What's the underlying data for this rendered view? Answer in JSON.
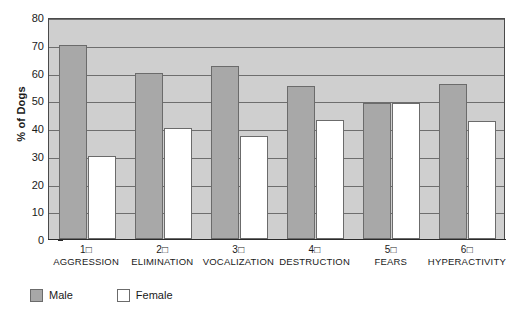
{
  "chart_data": {
    "type": "bar",
    "title": "",
    "subtitle": "",
    "xlabel": "",
    "ylabel": "% of Dogs",
    "ylim": [
      0,
      80
    ],
    "ytick_step": 10,
    "yticks": [
      0,
      10,
      20,
      30,
      40,
      50,
      60,
      70,
      80
    ],
    "ytick_labels": [
      "0",
      "10",
      "20",
      "30",
      "40",
      "50",
      "60",
      "70",
      "80"
    ],
    "grid": true,
    "grid_axis": "y",
    "legend_position": "below-bottom-left",
    "categories": [
      "AGGRESSION",
      "ELIMINATION",
      "VOCALIZATION",
      "DESTRUCTION",
      "FEARS",
      "HYPERACTIVITY"
    ],
    "category_numbers": [
      "1□",
      "2□",
      "3□",
      "4□",
      "5□",
      "6□"
    ],
    "series": [
      {
        "name": "Male",
        "color": "#a8a8a8",
        "values": [
          70,
          60,
          62.5,
          55,
          49,
          56
        ]
      },
      {
        "name": "Female",
        "color": "#ffffff",
        "values": [
          30,
          40,
          37,
          43,
          49,
          42.5
        ]
      }
    ],
    "plot_background": "#cfcfcf",
    "gridline_color": "#6e6e6e",
    "axis_color": "#2b2b2b",
    "bar_border_color": "#6b6b6b"
  },
  "legend": {
    "items": [
      {
        "label": "Male",
        "swatch": "male"
      },
      {
        "label": "Female",
        "swatch": "female"
      }
    ]
  }
}
